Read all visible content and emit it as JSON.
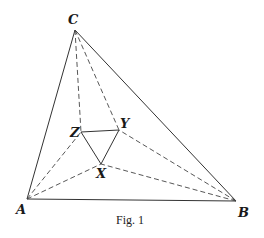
{
  "figure": {
    "caption": "Fig. 1",
    "points": {
      "A": {
        "label": "A",
        "x": 27,
        "y": 199
      },
      "B": {
        "label": "B",
        "x": 236,
        "y": 201
      },
      "C": {
        "label": "C",
        "x": 75,
        "y": 30
      },
      "X": {
        "label": "X",
        "x": 101,
        "y": 164
      },
      "Y": {
        "label": "Y",
        "x": 119,
        "y": 130
      },
      "Z": {
        "label": "Z",
        "x": 81,
        "y": 132
      }
    },
    "solid_segments": [
      [
        "A",
        "B"
      ],
      [
        "B",
        "C"
      ],
      [
        "C",
        "A"
      ],
      [
        "X",
        "Y"
      ],
      [
        "Y",
        "Z"
      ],
      [
        "Z",
        "X"
      ]
    ],
    "dashed_segments": [
      [
        "C",
        "Z"
      ],
      [
        "C",
        "Y"
      ],
      [
        "A",
        "Z"
      ],
      [
        "A",
        "X"
      ],
      [
        "B",
        "X"
      ],
      [
        "B",
        "Y"
      ]
    ],
    "colors": {
      "line": "#333333",
      "background": "#ffffff"
    }
  }
}
